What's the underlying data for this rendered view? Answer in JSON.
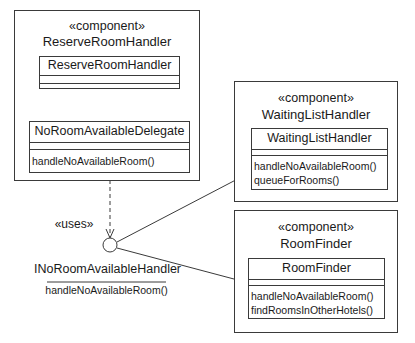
{
  "diagram": {
    "type": "UML component diagram",
    "components": [
      {
        "stereotype": "«component»",
        "name": "ReserveRoomHandler",
        "classes": [
          {
            "name": "ReserveRoomHandler",
            "operations": []
          },
          {
            "name": "NoRoomAvailableDelegate",
            "operations": [
              "handleNoAvailableRoom()"
            ]
          }
        ]
      },
      {
        "stereotype": "«component»",
        "name": "WaitingListHandler",
        "classes": [
          {
            "name": "WaitingListHandler",
            "operations": [
              "handleNoAvailableRoom()",
              "queueForRooms()"
            ]
          }
        ]
      },
      {
        "stereotype": "«component»",
        "name": "RoomFinder",
        "classes": [
          {
            "name": "RoomFinder",
            "operations": [
              "handleNoAvailableRoom()",
              "findRoomsInOtherHotels()"
            ]
          }
        ]
      }
    ],
    "interface": {
      "name": "INoRoomAvailableHandler",
      "operation": "handleNoAvailableRoom()"
    },
    "dependency_label": "«uses»",
    "colors": {
      "line": "#3a3a3a",
      "background": "#ffffff",
      "text": "#1a1a1a"
    }
  }
}
